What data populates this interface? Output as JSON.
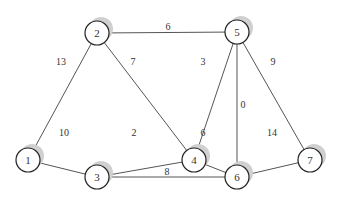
{
  "diagram": {
    "type": "weighted-undirected-graph",
    "nodes": [
      {
        "id": "1",
        "label": "1",
        "x": 28,
        "y": 54
      },
      {
        "id": "2",
        "label": "2",
        "x": 97,
        "y": 33
      },
      {
        "id": "3",
        "label": "3",
        "x": 97,
        "y": 177
      },
      {
        "id": "4",
        "label": "4",
        "x": 194,
        "y": 110
      },
      {
        "id": "5",
        "label": "5",
        "x": 237,
        "y": 32
      },
      {
        "id": "6",
        "label": "6",
        "x": 237,
        "y": 177
      },
      {
        "id": "7",
        "label": "7",
        "x": 310,
        "y": 110
      }
    ],
    "edges": [
      {
        "from": "1",
        "to": "2",
        "weight": "13"
      },
      {
        "from": "1",
        "to": "3",
        "weight": "10"
      },
      {
        "from": "2",
        "to": "5",
        "weight": "6"
      },
      {
        "from": "2",
        "to": "4",
        "weight": "7"
      },
      {
        "from": "3",
        "to": "4",
        "weight": "2"
      },
      {
        "from": "3",
        "to": "6",
        "weight": "8"
      },
      {
        "from": "4",
        "to": "5",
        "weight": "3"
      },
      {
        "from": "4",
        "to": "6",
        "weight": "6"
      },
      {
        "from": "5",
        "to": "6",
        "weight": "0"
      },
      {
        "from": "5",
        "to": "7",
        "weight": "9"
      },
      {
        "from": "6",
        "to": "7",
        "weight": "14"
      }
    ]
  }
}
